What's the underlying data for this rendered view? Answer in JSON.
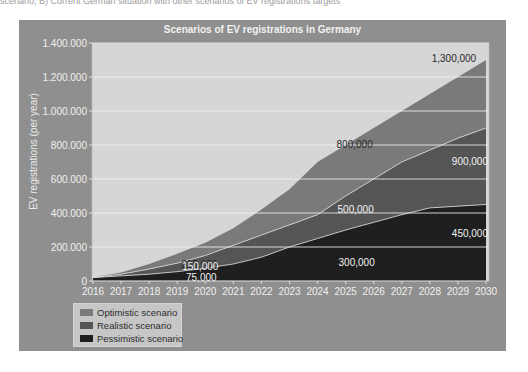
{
  "page": {
    "top_caption": "scenario; B) Current German situation with other scenarios of EV registrations targets"
  },
  "chart_data": {
    "type": "area",
    "stacked_display": true,
    "title": "Scenarios of EV registrations in Germany",
    "xlabel": "",
    "ylabel": "EV registrations (per year)",
    "x": [
      2016,
      2017,
      2018,
      2019,
      2020,
      2021,
      2022,
      2023,
      2024,
      2025,
      2026,
      2027,
      2028,
      2029,
      2030
    ],
    "x_tick_labels": [
      "2016",
      "2017",
      "2018",
      "2019",
      "2020",
      "2021",
      "2022",
      "2023",
      "2024",
      "2025",
      "2026",
      "2027",
      "2028",
      "2029",
      "2030"
    ],
    "y_tick_labels": [
      "0",
      "200.000",
      "400.000",
      "600.000",
      "800.000",
      "1.000.000",
      "1.200.000",
      "1.400.000"
    ],
    "y_ticks": [
      0,
      200000,
      400000,
      600000,
      800000,
      1000000,
      1200000,
      1400000
    ],
    "ylim": [
      0,
      1400000
    ],
    "grid": true,
    "legend_position": "bottom-left",
    "series": [
      {
        "name": "Optimistic scenario",
        "color": "#7a7a7a",
        "values": [
          20000,
          50000,
          100000,
          160000,
          225000,
          310000,
          420000,
          540000,
          700000,
          800000,
          900000,
          1000000,
          1100000,
          1200000,
          1300000
        ]
      },
      {
        "name": "Realistic scenario",
        "color": "#555555",
        "values": [
          20000,
          40000,
          70000,
          105000,
          150000,
          210000,
          270000,
          330000,
          390000,
          500000,
          600000,
          700000,
          770000,
          840000,
          900000
        ]
      },
      {
        "name": "Pessimistic scenario",
        "color": "#1f1f1f",
        "values": [
          20000,
          30000,
          40000,
          55000,
          75000,
          100000,
          140000,
          200000,
          250000,
          300000,
          345000,
          390000,
          430000,
          440000,
          450000
        ]
      }
    ],
    "annotations": [
      {
        "text": "225,000",
        "x": 2020,
        "series": "Optimistic scenario"
      },
      {
        "text": "150,000",
        "x": 2020,
        "series": "Realistic scenario"
      },
      {
        "text": "75,000",
        "x": 2020,
        "series": "Pessimistic scenario"
      },
      {
        "text": "800,000",
        "x": 2025,
        "series": "Optimistic scenario"
      },
      {
        "text": "500,000",
        "x": 2025,
        "series": "Realistic scenario"
      },
      {
        "text": "300,000",
        "x": 2025,
        "series": "Pessimistic scenario"
      },
      {
        "text": "1,300,000",
        "x": 2030,
        "series": "Optimistic scenario"
      },
      {
        "text": "900,000",
        "x": 2030,
        "series": "Realistic scenario"
      },
      {
        "text": "450,000",
        "x": 2030,
        "series": "Pessimistic scenario"
      }
    ],
    "colors": {
      "background": "#8f8f8f",
      "plot_background": "#d6d6d6",
      "gridline": "#f0f0f0"
    }
  }
}
